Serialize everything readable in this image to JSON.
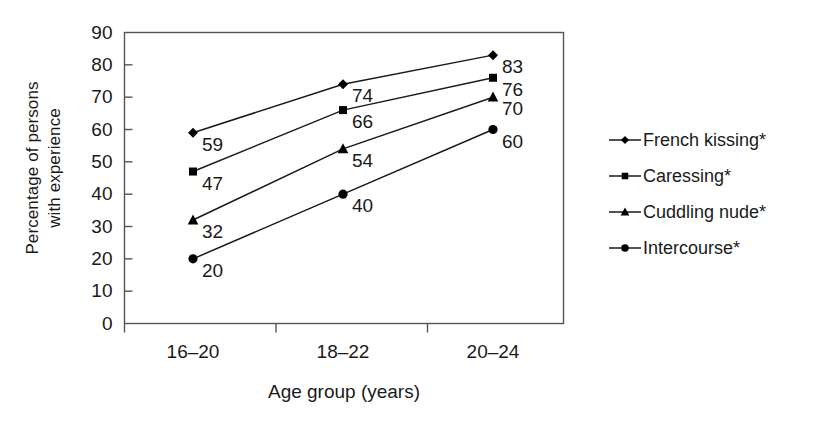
{
  "chart_data": {
    "type": "line",
    "title": "",
    "xlabel": "Age group (years)",
    "ylabel": "Percentage of persons with experience",
    "ylabel_line1": "Percentage of persons",
    "ylabel_line2": "with experience",
    "categories": [
      "16–20",
      "18–22",
      "20–24"
    ],
    "ylim": [
      0,
      90
    ],
    "yticks": [
      0,
      10,
      20,
      30,
      40,
      50,
      60,
      70,
      80,
      90
    ],
    "ytick_labels": [
      "0",
      "10",
      "20",
      "30",
      "40",
      "50",
      "60",
      "70",
      "80",
      "90"
    ],
    "grid": false,
    "legend_position": "right",
    "series": [
      {
        "name": "French kissing*",
        "marker": "diamond",
        "values": [
          59,
          74,
          83
        ],
        "labels": [
          "59",
          "74",
          "83"
        ]
      },
      {
        "name": "Caressing*",
        "marker": "square",
        "values": [
          47,
          66,
          76
        ],
        "labels": [
          "47",
          "66",
          "76"
        ]
      },
      {
        "name": "Cuddling nude*",
        "marker": "triangle",
        "values": [
          32,
          54,
          70
        ],
        "labels": [
          "32",
          "54",
          "70"
        ]
      },
      {
        "name": "Intercourse*",
        "marker": "circle",
        "values": [
          20,
          40,
          60
        ],
        "labels": [
          "20",
          "40",
          "60"
        ]
      }
    ],
    "colors": {
      "line": "#1a1a1a",
      "marker": "#000000",
      "axis": "#555555",
      "text": "#1a1a1a",
      "background": "#ffffff"
    }
  }
}
